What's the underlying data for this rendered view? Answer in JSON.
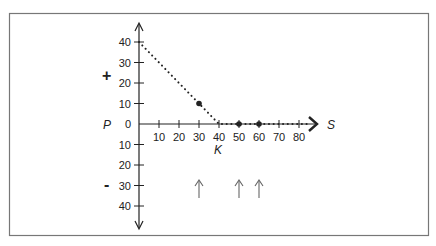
{
  "chart_data": {
    "type": "line",
    "title": "",
    "xlabel": "S",
    "ylabel": "P",
    "strike_label": "K",
    "positive_region_label": "+",
    "negative_region_label": "-",
    "x_ticks": [
      10,
      20,
      30,
      40,
      50,
      60,
      70,
      80
    ],
    "y_ticks_positive": [
      40,
      30,
      20,
      10
    ],
    "y_zero_label": "0",
    "y_ticks_negative": [
      10,
      20,
      30,
      40
    ],
    "xlim": [
      0,
      85
    ],
    "ylim": [
      -45,
      45
    ],
    "grid": false,
    "legend": null,
    "series": [
      {
        "name": "payoff",
        "style": "dotted",
        "x": [
          0,
          40,
          85
        ],
        "y": [
          40,
          0,
          0
        ]
      }
    ],
    "highlighted_points": [
      {
        "x": 30,
        "y": 10
      },
      {
        "x": 50,
        "y": 0
      },
      {
        "x": 60,
        "y": 0
      }
    ],
    "annotation_arrows_at_x": [
      30,
      50,
      60
    ],
    "colors": {
      "ink": "#222222",
      "frame": "#777777",
      "arrows": "#666666"
    }
  }
}
